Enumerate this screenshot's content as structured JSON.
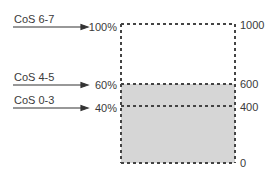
{
  "diagram": {
    "classes": [
      {
        "label": "CoS 6-7",
        "percent": "100%"
      },
      {
        "label": "CoS 4-5",
        "percent": "60%"
      },
      {
        "label": "CoS 0-3",
        "percent": "40%"
      }
    ],
    "scale": [
      "1000",
      "600",
      "400",
      "0"
    ],
    "colors": {
      "fill": "#d6d6d6",
      "line": "#444444",
      "text": "#3a3a3a"
    }
  }
}
